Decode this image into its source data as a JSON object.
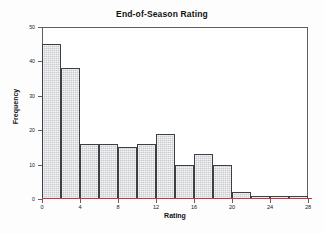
{
  "chart_data": {
    "type": "bar",
    "title": "End-of-Season Rating",
    "xlabel": "Rating",
    "ylabel": "Frequency",
    "xlim": [
      0,
      28
    ],
    "ylim": [
      0,
      50
    ],
    "grid": false,
    "legend": false,
    "bin_width": 2,
    "x_ticks": [
      0,
      4,
      8,
      12,
      16,
      20,
      24,
      28
    ],
    "y_ticks": [
      0,
      10,
      20,
      30,
      40,
      50
    ],
    "categories": [
      "0-2",
      "2-4",
      "4-6",
      "6-8",
      "8-10",
      "10-12",
      "12-14",
      "14-16",
      "16-18",
      "18-20",
      "20-22",
      "22-24",
      "24-26",
      "26-28"
    ],
    "bin_starts": [
      0,
      2,
      4,
      6,
      8,
      10,
      12,
      14,
      16,
      18,
      20,
      22,
      24,
      26
    ],
    "values": [
      45,
      38,
      16,
      16,
      15,
      16,
      19,
      10,
      13,
      10,
      2,
      1,
      1,
      1
    ],
    "colors": {
      "bar_fill": "#c9cace",
      "bar_edge": "#3c4046",
      "axis": "#5b5f66",
      "reference_line": "#d4303c",
      "text": "#111111",
      "background": "#ffffff"
    }
  }
}
